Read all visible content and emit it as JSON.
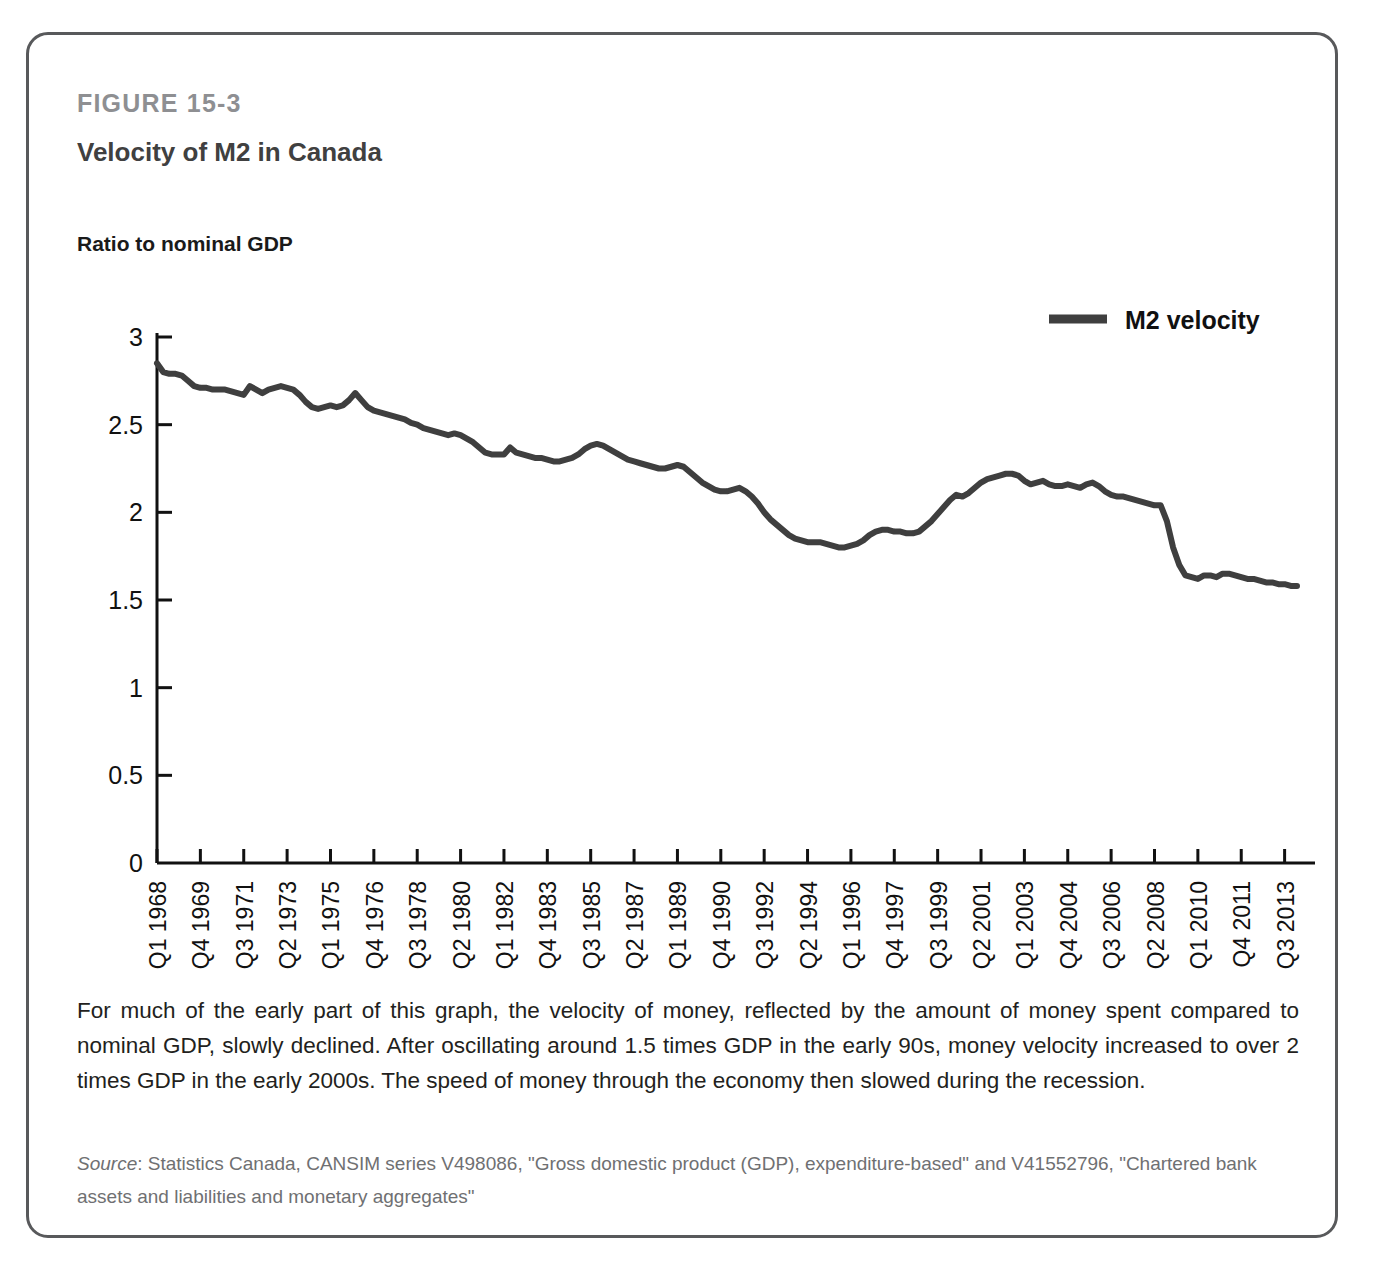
{
  "figure": {
    "number": "FIGURE 15-3",
    "title": "Velocity of M2 in Canada",
    "axis_title": "Ratio to nominal GDP",
    "caption": "For much of the early part of this graph, the velocity of money, reflected by the amount of money spent compared to nominal GDP, slowly declined. After oscillating around 1.5 times GDP in the early 90s, money velocity increased to over 2 times GDP in the early 2000s. The speed of money through the economy then slowed during the recession.",
    "source_label": "Source",
    "source_text": ": Statistics Canada, CANSIM series V498086, \"Gross domestic product (GDP), expenditure-based\" and V41552796, \"Chartered bank assets and liabilities and monetary aggregates\"",
    "border_color": "#58595b"
  },
  "chart_data": {
    "type": "line",
    "title": "Velocity of M2 in Canada",
    "subtitle": "FIGURE 15-3",
    "xlabel": "",
    "ylabel": "Ratio to nominal GDP",
    "ylim": [
      0,
      3
    ],
    "yticks": [
      "0",
      "0.5",
      "1",
      "1.5",
      "2",
      "2.5",
      "3"
    ],
    "ytick_values": [
      0,
      0.5,
      1,
      1.5,
      2,
      2.5,
      3
    ],
    "grid": false,
    "legend_position": "top-right",
    "series": [
      {
        "name": "M2 velocity",
        "color": "#3f3f3f",
        "line_width": 6,
        "values": [
          2.85,
          2.8,
          2.79,
          2.79,
          2.78,
          2.75,
          2.72,
          2.71,
          2.71,
          2.7,
          2.7,
          2.7,
          2.69,
          2.68,
          2.67,
          2.72,
          2.7,
          2.68,
          2.7,
          2.71,
          2.72,
          2.71,
          2.7,
          2.67,
          2.63,
          2.6,
          2.59,
          2.6,
          2.61,
          2.6,
          2.61,
          2.64,
          2.68,
          2.64,
          2.6,
          2.58,
          2.57,
          2.56,
          2.55,
          2.54,
          2.53,
          2.51,
          2.5,
          2.48,
          2.47,
          2.46,
          2.45,
          2.44,
          2.45,
          2.44,
          2.42,
          2.4,
          2.37,
          2.34,
          2.33,
          2.33,
          2.33,
          2.37,
          2.34,
          2.33,
          2.32,
          2.31,
          2.31,
          2.3,
          2.29,
          2.29,
          2.3,
          2.31,
          2.33,
          2.36,
          2.38,
          2.39,
          2.38,
          2.36,
          2.34,
          2.32,
          2.3,
          2.29,
          2.28,
          2.27,
          2.26,
          2.25,
          2.25,
          2.26,
          2.27,
          2.26,
          2.23,
          2.2,
          2.17,
          2.15,
          2.13,
          2.12,
          2.12,
          2.13,
          2.14,
          2.12,
          2.09,
          2.05,
          2.0,
          1.96,
          1.93,
          1.9,
          1.87,
          1.85,
          1.84,
          1.83,
          1.83,
          1.83,
          1.82,
          1.81,
          1.8,
          1.8,
          1.81,
          1.82,
          1.84,
          1.87,
          1.89,
          1.9,
          1.9,
          1.89,
          1.89,
          1.88,
          1.88,
          1.89,
          1.92,
          1.95,
          1.99,
          2.03,
          2.07,
          2.1,
          2.09,
          2.11,
          2.14,
          2.17,
          2.19,
          2.2,
          2.21,
          2.22,
          2.22,
          2.21,
          2.18,
          2.16,
          2.17,
          2.18,
          2.16,
          2.15,
          2.15,
          2.16,
          2.15,
          2.14,
          2.16,
          2.17,
          2.15,
          2.12,
          2.1,
          2.09,
          2.09,
          2.08,
          2.07,
          2.06,
          2.05,
          2.04,
          2.04,
          1.95,
          1.8,
          1.7,
          1.64,
          1.63,
          1.62,
          1.64,
          1.64,
          1.63,
          1.65,
          1.65,
          1.64,
          1.63,
          1.62,
          1.62,
          1.61,
          1.6,
          1.6,
          1.59,
          1.59,
          1.58,
          1.58
        ]
      }
    ],
    "xtick_labels": [
      "Q1 1968",
      "Q4 1969",
      "Q3 1971",
      "Q2 1973",
      "Q1 1975",
      "Q4 1976",
      "Q3 1978",
      "Q2 1980",
      "Q1 1982",
      "Q4 1983",
      "Q3 1985",
      "Q2 1987",
      "Q1 1989",
      "Q4 1990",
      "Q3 1992",
      "Q2 1994",
      "Q1 1996",
      "Q4 1997",
      "Q3 1999",
      "Q2 2001",
      "Q1 2003",
      "Q4 2004",
      "Q3 2006",
      "Q2 2008",
      "Q1 2010",
      "Q4 2011",
      "Q3 2013"
    ],
    "xtick_step_quarters": 7,
    "legend": [
      {
        "label": "M2 velocity",
        "color": "#3f3f3f"
      }
    ]
  }
}
